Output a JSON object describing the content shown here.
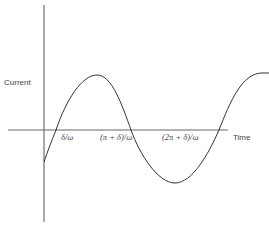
{
  "diagram": {
    "title": "",
    "y_axis_label": "Current",
    "x_axis_label": "Time",
    "tick_labels": [
      "δ/ω",
      "(π + δ)/ω",
      "(2π + δ)/ω"
    ],
    "curve": "sinusoid i(t) = I sin(ωt − δ)",
    "colors": {
      "line": "#333333",
      "axis": "#555555",
      "background": "#ffffff"
    }
  }
}
